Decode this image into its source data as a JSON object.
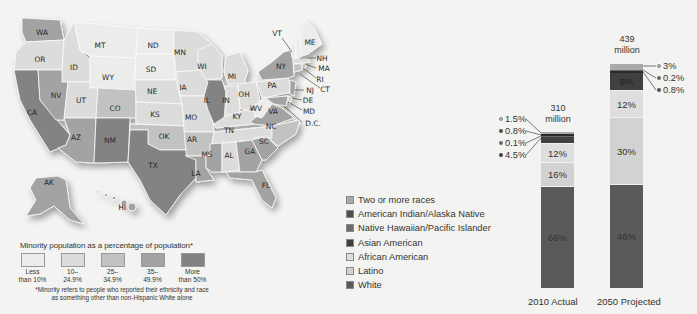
{
  "map": {
    "states": {
      "WA": "WA",
      "OR": "OR",
      "CA": "CA",
      "ID": "ID",
      "NV": "NV",
      "MT": "MT",
      "WY": "WY",
      "UT": "UT",
      "AZ": "AZ",
      "CO": "CO",
      "NM": "NM",
      "ND": "ND",
      "SD": "SD",
      "NE": "NE",
      "KS": "KS",
      "OK": "OK",
      "TX": "TX",
      "MN": "MN",
      "IA": "IA",
      "MO": "MO",
      "AR": "AR",
      "LA": "LA",
      "WI": "WI",
      "IL": "IL",
      "MI": "MI",
      "IN": "IN",
      "OH": "OH",
      "KY": "KY",
      "TN": "TN",
      "MS": "MS",
      "AL": "AL",
      "GA": "GA",
      "FL": "FL",
      "SC": "SC",
      "NC": "NC",
      "VA": "VA",
      "WV": "WV",
      "PA": "PA",
      "NY": "NY",
      "VT": "VT",
      "ME": "ME",
      "NH": "NH",
      "MA": "MA",
      "RI": "RI",
      "CT": "CT",
      "NJ": "NJ",
      "DE": "DE",
      "MD": "MD",
      "DC": "D.C.",
      "AK": "AK",
      "HI": "HI"
    },
    "legend": {
      "title": "Minority population as a percentage of population*",
      "bins": [
        {
          "line1": "Less",
          "line2": "than 10%",
          "color": "#ececea"
        },
        {
          "line1": "10–",
          "line2": "24.9%",
          "color": "#dcdcdb"
        },
        {
          "line1": "25–",
          "line2": "34.9%",
          "color": "#c2c2c1"
        },
        {
          "line1": "35–",
          "line2": "49.9%",
          "color": "#a3a3a3"
        },
        {
          "line1": "More",
          "line2": "than 50%",
          "color": "#838383"
        }
      ],
      "note_line1": "*Minority refers to people who reported their ethnicity and race",
      "note_line2": "as something other than non-Hispanic White alone"
    }
  },
  "chart_data": {
    "type": "bar",
    "stacked": true,
    "categories": [
      "2010 Actual",
      "2050 Projected"
    ],
    "totals": [
      "310 million",
      "439 million"
    ],
    "total_value_millions": [
      310,
      439
    ],
    "legend_position": "left",
    "series": [
      {
        "name": "White",
        "color": "#5a5a5a",
        "values": [
          66,
          46
        ]
      },
      {
        "name": "Latino",
        "color": "#d2d2d2",
        "values": [
          16,
          30
        ]
      },
      {
        "name": "African American",
        "color": "#dedede",
        "values": [
          12,
          12
        ]
      },
      {
        "name": "Asian American",
        "color": "#404040",
        "values": [
          4.5,
          8
        ]
      },
      {
        "name": "Native Hawaiian/Pacific Islander",
        "color": "#6a6a6a",
        "values": [
          0.1,
          0.2
        ]
      },
      {
        "name": "American Indian/Alaska Native",
        "color": "#4f4f4f",
        "values": [
          0.8,
          0.8
        ]
      },
      {
        "name": "Two or more races",
        "color": "#aaaaaa",
        "values": [
          1.5,
          3
        ]
      }
    ],
    "legend_order": [
      "Two or more races",
      "American Indian/Alaska Native",
      "Native Hawaiian/Pacific Islander",
      "Asian American",
      "African American",
      "Latino",
      "White"
    ],
    "segment_labels": {
      "2010 Actual": {
        "White": "66%",
        "Latino": "16%",
        "African American": "12%"
      },
      "2050 Projected": {
        "White": "46%",
        "Latino": "30%",
        "African American": "12%",
        "Asian American": "8%"
      }
    },
    "callouts": {
      "2010 Actual": [
        {
          "text": "1.5%",
          "color": "#aaaaaa"
        },
        {
          "text": "0.8%",
          "color": "#4f4f4f"
        },
        {
          "text": "0.1%",
          "color": "#6a6a6a"
        },
        {
          "text": "4.5%",
          "color": "#404040"
        }
      ],
      "2050 Projected": [
        {
          "text": "3%",
          "color": "#aaaaaa"
        },
        {
          "text": "0.2%",
          "color": "#6a6a6a"
        },
        {
          "text": "0.8%",
          "color": "#4f4f4f"
        }
      ]
    }
  }
}
